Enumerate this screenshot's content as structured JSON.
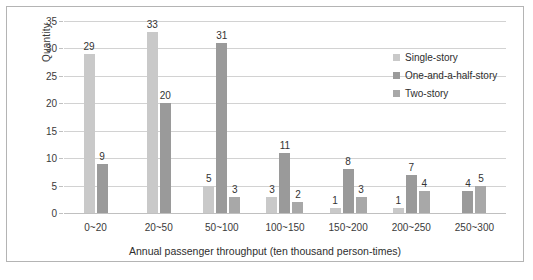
{
  "chart_data": {
    "type": "bar",
    "title": "",
    "xlabel": "Annual passenger throughput (ten thousand person-times)",
    "ylabel": "Quantity",
    "categories": [
      "0~20",
      "20~50",
      "50~100",
      "100~150",
      "150~200",
      "200~250",
      "250~300"
    ],
    "ylim": [
      0,
      35
    ],
    "yticks": [
      0,
      5,
      10,
      15,
      20,
      25,
      30,
      35
    ],
    "grid": true,
    "legend_position": "top-right",
    "series": [
      {
        "name": "Single-story",
        "color": "#c9c9c9",
        "values": [
          29,
          33,
          5,
          3,
          1,
          1,
          null
        ],
        "labels": [
          "29",
          "33",
          "5",
          "3",
          "1",
          "1",
          ""
        ]
      },
      {
        "name": "One-and-a-half-story",
        "color": "#9a9a9a",
        "values": [
          9,
          20,
          31,
          11,
          8,
          7,
          4
        ],
        "labels": [
          "9",
          "20",
          "31",
          "11",
          "8",
          "7",
          "4"
        ]
      },
      {
        "name": "Two-story",
        "color": "#a8a8a8",
        "values": [
          null,
          null,
          3,
          2,
          3,
          4,
          5
        ],
        "labels": [
          "",
          "",
          "3",
          "2",
          "3",
          "4",
          "5"
        ]
      }
    ]
  },
  "axes": {
    "y_title": "Quantity",
    "x_title": "Annual passenger throughput (ten thousand person-times)",
    "y_tick_labels": [
      "35",
      "30",
      "25",
      "20",
      "15",
      "10",
      "5",
      "0"
    ],
    "x_tick_labels": [
      "0~20",
      "20~50",
      "50~100",
      "100~150",
      "150~200",
      "200~250",
      "250~300"
    ]
  },
  "legend": {
    "items": [
      {
        "label": "Single-story",
        "color": "#c9c9c9"
      },
      {
        "label": "One-and-a-half-story",
        "color": "#9a9a9a"
      },
      {
        "label": "Two-story",
        "color": "#a8a8a8"
      }
    ]
  },
  "colors": {
    "frame": "#b4b4b4",
    "gridline": "#d2d2d2",
    "text": "#2e2e2e"
  }
}
